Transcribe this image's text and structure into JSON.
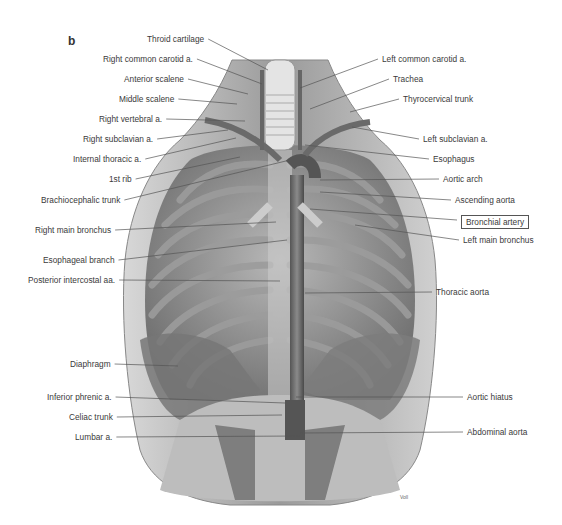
{
  "figure": {
    "panel_letter": "b",
    "signature": "Voll",
    "labels_left": [
      {
        "id": "throid-cartilage",
        "text": "Throid cartilage",
        "x": 147,
        "y": 39,
        "tx": 268,
        "ty": 70
      },
      {
        "id": "right-common-carotid",
        "text": "Right common carotid a.",
        "x": 103,
        "y": 59,
        "tx": 262,
        "ty": 84
      },
      {
        "id": "anterior-scalene",
        "text": "Anterior scalene",
        "x": 124,
        "y": 79,
        "tx": 248,
        "ty": 94
      },
      {
        "id": "middle-scalene",
        "text": "Middle scalene",
        "x": 119,
        "y": 99,
        "tx": 237,
        "ty": 104
      },
      {
        "id": "right-vertebral",
        "text": "Right vertebral a.",
        "x": 99,
        "y": 119,
        "tx": 245,
        "ty": 121
      },
      {
        "id": "right-subclavian",
        "text": "Right subclavian a.",
        "x": 83,
        "y": 139,
        "tx": 228,
        "ty": 130
      },
      {
        "id": "internal-thoracic",
        "text": "Internal thoracic a.",
        "x": 73,
        "y": 159,
        "tx": 236,
        "ty": 138
      },
      {
        "id": "first-rib",
        "text": "1st rib",
        "x": 109,
        "y": 179,
        "tx": 240,
        "ty": 157
      },
      {
        "id": "brachiocephalic-trunk",
        "text": "Brachiocephalic trunk",
        "x": 41,
        "y": 200,
        "tx": 290,
        "ty": 160
      },
      {
        "id": "right-main-bronchus",
        "text": "Right main bronchus",
        "x": 35,
        "y": 230,
        "tx": 276,
        "ty": 222
      },
      {
        "id": "esophageal-branch",
        "text": "Esophageal branch",
        "x": 43,
        "y": 260,
        "tx": 287,
        "ty": 240
      },
      {
        "id": "posterior-intercostal",
        "text": "Posterior intercostal aa.",
        "x": 28,
        "y": 280,
        "tx": 280,
        "ty": 281
      },
      {
        "id": "diaphragm",
        "text": "Diaphragm",
        "x": 70,
        "y": 364,
        "tx": 178,
        "ty": 366
      },
      {
        "id": "inferior-phrenic",
        "text": "Inferior phrenic a.",
        "x": 47,
        "y": 397,
        "tx": 285,
        "ty": 403
      },
      {
        "id": "celiac-trunk",
        "text": "Celiac trunk",
        "x": 69,
        "y": 417,
        "tx": 282,
        "ty": 415
      },
      {
        "id": "lumbar-a",
        "text": "Lumbar a.",
        "x": 75,
        "y": 437,
        "tx": 300,
        "ty": 436
      }
    ],
    "labels_right": [
      {
        "id": "left-common-carotid",
        "text": "Left common carotid a.",
        "x": 382,
        "y": 59,
        "tx": 300,
        "ty": 88
      },
      {
        "id": "trachea",
        "text": "Trachea",
        "x": 393,
        "y": 79,
        "tx": 310,
        "ty": 109
      },
      {
        "id": "thyrocervical-trunk",
        "text": "Thyrocervical trunk",
        "x": 403,
        "y": 99,
        "tx": 350,
        "ty": 112
      },
      {
        "id": "left-subclavian",
        "text": "Left subclavian a.",
        "x": 423,
        "y": 139,
        "tx": 352,
        "ty": 127
      },
      {
        "id": "esophagus",
        "text": "Esophagus",
        "x": 433,
        "y": 159,
        "tx": 305,
        "ty": 145
      },
      {
        "id": "aortic-arch",
        "text": "Aortic arch",
        "x": 443,
        "y": 179,
        "tx": 320,
        "ty": 180
      },
      {
        "id": "ascending-aorta",
        "text": "Ascending aorta",
        "x": 455,
        "y": 200,
        "tx": 320,
        "ty": 192
      },
      {
        "id": "bronchial-artery",
        "text": "Bronchial artery",
        "x": 461,
        "y": 220,
        "tx": 310,
        "ty": 209,
        "boxed": true
      },
      {
        "id": "left-main-bronchus",
        "text": "Left main bronchus",
        "x": 463,
        "y": 240,
        "tx": 355,
        "ty": 225
      },
      {
        "id": "thoracic-aorta",
        "text": "Thoracic aorta",
        "x": 436,
        "y": 292,
        "tx": 305,
        "ty": 293
      },
      {
        "id": "aortic-hiatus",
        "text": "Aortic hiatus",
        "x": 467,
        "y": 397,
        "tx": 296,
        "ty": 397
      },
      {
        "id": "abdominal-aorta",
        "text": "Abdominal aorta",
        "x": 467,
        "y": 432,
        "tx": 300,
        "ty": 433
      }
    ]
  }
}
